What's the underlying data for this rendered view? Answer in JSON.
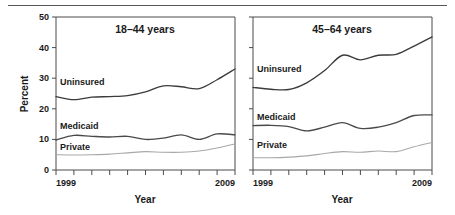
{
  "chart_data": {
    "type": "line",
    "title": "",
    "xlabel": "Year",
    "ylabel": "Percent",
    "ylim": [
      0,
      50
    ],
    "yticks": [
      0,
      10,
      20,
      30,
      40,
      50
    ],
    "ytick_labels": [
      "0",
      "10",
      "20",
      "30",
      "40",
      "50"
    ],
    "grid": false,
    "legend_position": "inline-annotations",
    "x": [
      1999,
      2000,
      2001,
      2002,
      2003,
      2004,
      2005,
      2006,
      2007,
      2008,
      2009
    ],
    "xtick_labels_shown": [
      "1999",
      "2009"
    ],
    "panels": [
      {
        "title": "18–44 years",
        "xlabel": "Year",
        "ylabel": "Percent",
        "x_start_label": "1999",
        "x_end_label": "2009",
        "series": [
          {
            "name": "Uninsured",
            "label": "Uninsured",
            "color": "#3b3b3b",
            "values": [
              24.0,
              23.0,
              23.8,
              24.0,
              24.3,
              25.5,
              27.5,
              27.2,
              26.6,
              29.5,
              33.0
            ]
          },
          {
            "name": "Medicaid",
            "label": "Medicaid",
            "color": "#4a4a4a",
            "values": [
              9.8,
              11.3,
              11.0,
              10.8,
              11.0,
              10.0,
              10.4,
              11.5,
              10.0,
              11.8,
              11.5
            ]
          },
          {
            "name": "Private",
            "label": "Private",
            "color": "#a8a8a8",
            "values": [
              5.0,
              4.9,
              5.0,
              5.2,
              5.6,
              6.0,
              5.8,
              5.8,
              6.2,
              7.2,
              8.5
            ]
          }
        ]
      },
      {
        "title": "45–64 years",
        "xlabel": "Year",
        "ylabel": "Percent",
        "x_start_label": "1999",
        "x_end_label": "2009",
        "series": [
          {
            "name": "Uninsured",
            "label": "Uninsured",
            "color": "#3b3b3b",
            "values": [
              27.0,
              26.4,
              26.3,
              28.5,
              32.5,
              37.5,
              36.0,
              37.5,
              37.8,
              40.5,
              43.5
            ]
          },
          {
            "name": "Medicaid",
            "label": "Medicaid",
            "color": "#4a4a4a",
            "values": [
              14.5,
              14.6,
              14.2,
              12.8,
              14.0,
              15.5,
              13.6,
              14.0,
              15.5,
              17.8,
              18.0
            ]
          },
          {
            "name": "Private",
            "label": "Private",
            "color": "#a8a8a8",
            "values": [
              4.0,
              4.0,
              4.2,
              4.6,
              5.4,
              6.0,
              5.8,
              6.2,
              6.0,
              7.6,
              9.0
            ]
          }
        ]
      }
    ]
  },
  "axes": {
    "percent_label": "Percent",
    "year_label": "Year"
  }
}
